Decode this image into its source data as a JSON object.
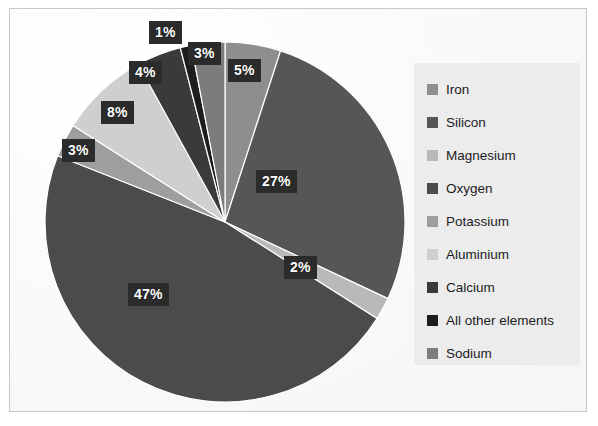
{
  "chart_data": {
    "type": "pie",
    "title": "",
    "subtitle": "",
    "xlabel": "",
    "ylabel": "",
    "legend_position": "right",
    "grid": false,
    "units": "%",
    "total": 100,
    "categories": [
      "Iron",
      "Silicon",
      "Magnesium",
      "Oxygen",
      "Potassium",
      "Aluminium",
      "Calcium",
      "All other elements",
      "Sodium"
    ],
    "values": [
      5,
      27,
      2,
      47,
      3,
      8,
      4,
      1,
      3
    ],
    "slice_labels": [
      "5%",
      "27%",
      "2%",
      "47%",
      "3%",
      "8%",
      "4%",
      "1%",
      "3%"
    ],
    "colors": [
      "#8e8e8e",
      "#565656",
      "#b9b9b9",
      "#4b4b4b",
      "#9e9e9e",
      "#cfcfcf",
      "#3a3a3a",
      "#1d1d1d",
      "#7c7c7c"
    ],
    "slices": [
      {
        "label": "Iron",
        "value": 5,
        "display": "5%",
        "color": "#8e8e8e"
      },
      {
        "label": "Silicon",
        "value": 27,
        "display": "27%",
        "color": "#565656"
      },
      {
        "label": "Magnesium",
        "value": 2,
        "display": "2%",
        "color": "#b9b9b9"
      },
      {
        "label": "Oxygen",
        "value": 47,
        "display": "47%",
        "color": "#4b4b4b"
      },
      {
        "label": "Potassium",
        "value": 3,
        "display": "3%",
        "color": "#9e9e9e"
      },
      {
        "label": "Aluminium",
        "value": 8,
        "display": "8%",
        "color": "#cfcfcf"
      },
      {
        "label": "Calcium",
        "value": 4,
        "display": "4%",
        "color": "#3a3a3a"
      },
      {
        "label": "All other elements",
        "value": 1,
        "display": "1%",
        "color": "#1d1d1d"
      },
      {
        "label": "Sodium",
        "value": 3,
        "display": "3%",
        "color": "#7c7c7c"
      }
    ]
  },
  "legend": {
    "items": [
      {
        "label": "Iron",
        "color": "#8e8e8e"
      },
      {
        "label": "Silicon",
        "color": "#565656"
      },
      {
        "label": "Magnesium",
        "color": "#b9b9b9"
      },
      {
        "label": "Oxygen",
        "color": "#4b4b4b"
      },
      {
        "label": "Potassium",
        "color": "#9e9e9e"
      },
      {
        "label": "Aluminium",
        "color": "#cfcfcf"
      },
      {
        "label": "Calcium",
        "color": "#3a3a3a"
      },
      {
        "label": "All other elements",
        "color": "#1d1d1d"
      },
      {
        "label": "Sodium",
        "color": "#7c7c7c"
      }
    ]
  },
  "labels": {
    "l0": "5%",
    "l1": "27%",
    "l2": "2%",
    "l3": "47%",
    "l4": "3%",
    "l5": "8%",
    "l6": "4%",
    "l7": "1%",
    "l8": "3%"
  },
  "style": {
    "background": "#ffffff",
    "border_color": "#c8c8c8",
    "legend_background": "#ececed",
    "label_background": "#2b2b2b",
    "label_text_color": "#ffffff"
  }
}
